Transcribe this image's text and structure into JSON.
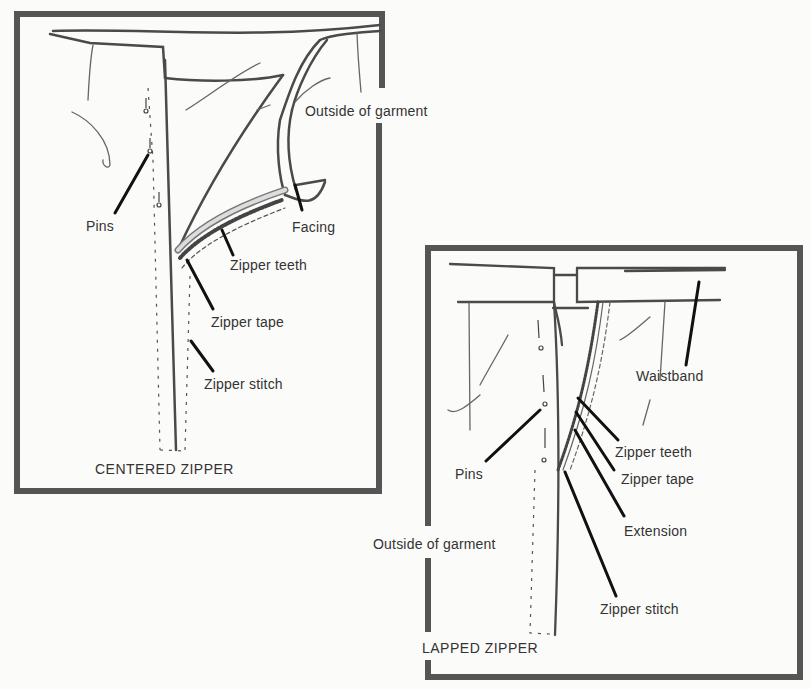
{
  "panels": [
    {
      "title": "CENTERED ZIPPER",
      "labels": {
        "outside": "Outside of garment",
        "pins": "Pins",
        "facing": "Facing",
        "teeth": "Zipper teeth",
        "tape": "Zipper tape",
        "stitch": "Zipper stitch"
      }
    },
    {
      "title": "LAPPED ZIPPER",
      "labels": {
        "waistband": "Waistband",
        "pins": "Pins",
        "teeth": "Zipper teeth",
        "tape": "Zipper tape",
        "extension": "Extension",
        "outside": "Outside of garment",
        "stitch": "Zipper stitch"
      }
    }
  ],
  "colors": {
    "frame": "#555555",
    "line": "#444444",
    "leader": "#111111",
    "background": "#fbfbf9"
  }
}
